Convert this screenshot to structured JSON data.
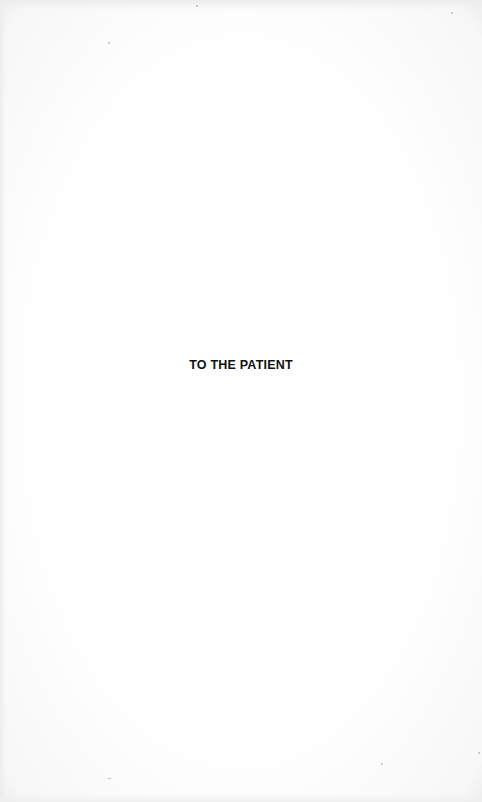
{
  "page": {
    "dedication": "TO THE PATIENT"
  }
}
